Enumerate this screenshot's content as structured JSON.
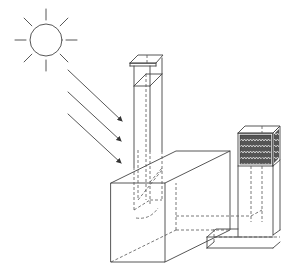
{
  "diagram": {
    "title": "",
    "colors": {
      "line": "#444444",
      "dashed": "#555555",
      "background": "#ffffff",
      "pad_fill": "#444444"
    },
    "sun": {
      "cx": 46,
      "cy": 40,
      "r": 16,
      "ray_inner": 20,
      "ray_outer": 31,
      "ray_count": 8
    },
    "sun_rays": [
      {
        "x1": 68,
        "y1": 70,
        "x2": 122,
        "y2": 121
      },
      {
        "x1": 68,
        "y1": 92,
        "x2": 121,
        "y2": 141
      },
      {
        "x1": 68,
        "y1": 114,
        "x2": 121,
        "y2": 163
      }
    ],
    "room_box": {
      "front": [
        [
          111,
          183
        ],
        [
          165,
          183
        ],
        [
          165,
          262
        ],
        [
          111,
          262
        ]
      ],
      "top": [
        [
          111,
          183
        ],
        [
          176,
          151
        ],
        [
          230,
          151
        ],
        [
          165,
          183
        ]
      ],
      "side": [
        [
          165,
          183
        ],
        [
          230,
          151
        ],
        [
          230,
          230
        ],
        [
          165,
          262
        ]
      ],
      "hidden_lines": [
        [
          [
            111,
            262
          ],
          [
            176,
            230
          ]
        ],
        [
          [
            176,
            230
          ],
          [
            176,
            151
          ]
        ],
        [
          [
            176,
            230
          ],
          [
            230,
            230
          ]
        ]
      ]
    },
    "chimney": {
      "top_cap": [
        [
          130,
          63
        ],
        [
          138,
          55
        ],
        [
          163,
          55
        ],
        [
          156,
          63
        ]
      ],
      "front_left_x": 134,
      "front_right_x": 150,
      "back_right_x": 162,
      "top_y": 68,
      "bottom_y": 151,
      "collar_y": 85
    },
    "pad_tower": {
      "front": [
        [
          238,
          133
        ],
        [
          273,
          133
        ],
        [
          273,
          166
        ],
        [
          238,
          166
        ]
      ],
      "top": [
        [
          238,
          133
        ],
        [
          245,
          126
        ],
        [
          280,
          126
        ],
        [
          273,
          133
        ]
      ],
      "side": [
        [
          273,
          133
        ],
        [
          280,
          126
        ],
        [
          280,
          160
        ],
        [
          273,
          166
        ]
      ],
      "label": ""
    },
    "duct": {
      "note": "vertical duct from pad down to ground then horizontal into room"
    }
  }
}
